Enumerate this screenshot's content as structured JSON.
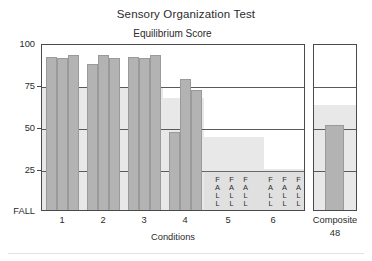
{
  "titles": {
    "main": "Sensory Organization Test",
    "sub": "Equilibrium Score",
    "xlabel": "Conditions"
  },
  "axis": {
    "yticks": [
      "100",
      "75",
      "50",
      "25",
      "FALL"
    ],
    "xticks": [
      "1",
      "2",
      "3",
      "4",
      "5",
      "6"
    ]
  },
  "composite": {
    "label": "Composite",
    "value": "48"
  },
  "fall_text": {
    "letters": "FALL",
    "l1": "F",
    "l2": "A",
    "l3": "L",
    "l4": "L"
  },
  "chart_data": {
    "type": "bar",
    "title": "Sensory Organization Test",
    "subtitle": "Equilibrium Score",
    "xlabel": "Conditions",
    "ylabel": "Equilibrium Score",
    "ylim": [
      0,
      100
    ],
    "ytick_values": [
      100,
      75,
      50,
      25,
      0
    ],
    "ytick_labels": [
      "100",
      "75",
      "50",
      "25",
      "FALL"
    ],
    "grid": "horizontal",
    "legend": "none",
    "categories": [
      "1",
      "2",
      "3",
      "4",
      "5",
      "6"
    ],
    "trials_per_condition": 3,
    "series": [
      {
        "name": "Trial 1",
        "values": [
          93,
          89,
          93,
          0,
          null,
          null
        ]
      },
      {
        "name": "Trial 2",
        "values": [
          92,
          94,
          92,
          80,
          null,
          null
        ]
      },
      {
        "name": "Trial 3",
        "values": [
          94,
          92,
          94,
          73,
          null,
          null
        ]
      }
    ],
    "fall_trials": {
      "4": [
        1
      ],
      "5": [
        1,
        2,
        3
      ],
      "6": [
        1,
        2,
        3
      ]
    },
    "normal_range_lower_limit": [
      75,
      75,
      75,
      68,
      45,
      45
    ],
    "composite": {
      "label": "Composite",
      "value": 48,
      "normal_lower_limit": 70
    },
    "bars": [
      {
        "condition": 1,
        "trial": 1,
        "value": 93
      },
      {
        "condition": 1,
        "trial": 2,
        "value": 92
      },
      {
        "condition": 1,
        "trial": 3,
        "value": 94
      },
      {
        "condition": 2,
        "trial": 1,
        "value": 89
      },
      {
        "condition": 2,
        "trial": 2,
        "value": 94
      },
      {
        "condition": 2,
        "trial": 3,
        "value": 92
      },
      {
        "condition": 3,
        "trial": 1,
        "value": 93
      },
      {
        "condition": 3,
        "trial": 2,
        "value": 92
      },
      {
        "condition": 3,
        "trial": 3,
        "value": 94
      },
      {
        "condition": 4,
        "trial": 1,
        "value": 48
      },
      {
        "condition": 4,
        "trial": 2,
        "value": 80
      },
      {
        "condition": 4,
        "trial": 3,
        "value": 73
      },
      {
        "condition": 5,
        "trial": 1,
        "value": 0
      },
      {
        "condition": 5,
        "trial": 2,
        "value": 0
      },
      {
        "condition": 5,
        "trial": 3,
        "value": 0
      },
      {
        "condition": 6,
        "trial": 1,
        "value": 0
      },
      {
        "condition": 6,
        "trial": 2,
        "value": 0
      },
      {
        "condition": 6,
        "trial": 3,
        "value": 0
      }
    ]
  },
  "colors": {
    "bar": "#b3b3b3",
    "band": "#e8e8e8",
    "frame": "#4a4a4a",
    "text": "#2b2b2b"
  }
}
